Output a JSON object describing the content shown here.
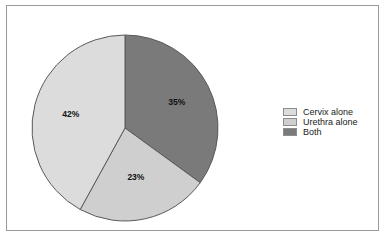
{
  "frame": {
    "border_color": "#9a9a9a",
    "background": "#ffffff"
  },
  "legend": {
    "position": "right",
    "items": [
      {
        "label": "Cervix alone",
        "color": "#dcdcdc",
        "swatch_name": "legend-swatch-cervix-alone"
      },
      {
        "label": "Urethra alone",
        "color": "#cfcfcf",
        "swatch_name": "legend-swatch-urethra-alone"
      },
      {
        "label": "Both",
        "color": "#7a7a7a",
        "swatch_name": "legend-swatch-both"
      }
    ]
  },
  "labels": {
    "both": "35%",
    "urethra": "23%",
    "cervix": "42%"
  },
  "chart_data": {
    "type": "pie",
    "title": "",
    "subtitle": "",
    "xlabel": "",
    "ylabel": "",
    "grid": false,
    "legend_position": "right",
    "start_angle_deg": 0,
    "direction": "clockwise",
    "categories": [
      "Both",
      "Urethra alone",
      "Cervix alone"
    ],
    "values": [
      35,
      23,
      42
    ],
    "value_labels": [
      "35%",
      "23%",
      "42%"
    ],
    "colors": [
      "#7a7a7a",
      "#cfcfcf",
      "#dcdcdc"
    ],
    "slice_edge_color": "#5a5a5a",
    "series": [
      {
        "name": "Detection site",
        "slices": [
          {
            "label": "Both",
            "value": 35,
            "display": "35%",
            "color": "#7a7a7a"
          },
          {
            "label": "Urethra alone",
            "value": 23,
            "display": "23%",
            "color": "#cfcfcf"
          },
          {
            "label": "Cervix alone",
            "value": 42,
            "display": "42%",
            "color": "#dcdcdc"
          }
        ]
      }
    ]
  }
}
